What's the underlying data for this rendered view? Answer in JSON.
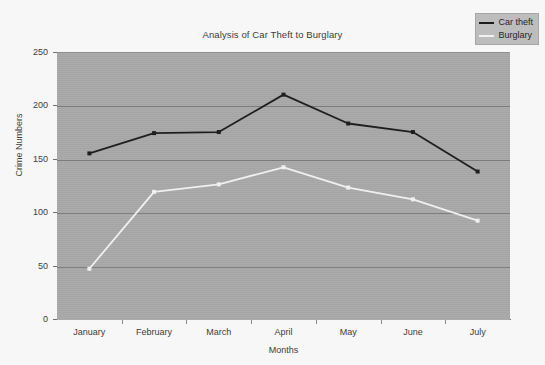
{
  "chart_data": {
    "type": "line",
    "title": "Analysis of Car Theft to Burglary",
    "xlabel": "Months",
    "ylabel": "Crime Numbers",
    "categories": [
      "January",
      "February",
      "March",
      "April",
      "May",
      "June",
      "July"
    ],
    "series": [
      {
        "name": "Car theft",
        "color": "#1c1c1c",
        "values": [
          156,
          175,
          176,
          211,
          184,
          176,
          139
        ]
      },
      {
        "name": "Burglary",
        "color": "#f2f2f2",
        "values": [
          48,
          120,
          127,
          143,
          124,
          113,
          93
        ]
      }
    ],
    "ylim": [
      0,
      250
    ],
    "yticks": [
      0,
      50,
      100,
      150,
      200,
      250
    ],
    "ytick_labels": [
      "0",
      "50",
      "100",
      "150",
      "200",
      "250"
    ],
    "grid": true,
    "legend_position": "top-right",
    "plot_background": "#a8a8a8",
    "figure_background": "#f7f7f7"
  },
  "legend": {
    "entries": [
      {
        "label": "Car theft"
      },
      {
        "label": "Burglary"
      }
    ]
  }
}
